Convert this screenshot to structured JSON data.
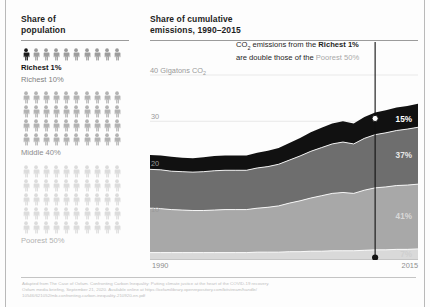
{
  "left_panel": {
    "title": "Share of\npopulation",
    "title_line1": "Share of",
    "title_line2": "population",
    "groups": [
      {
        "key": "richest1",
        "label": "Richest 1%",
        "rows": 0,
        "color": "#1a1a1a"
      },
      {
        "key": "richest10",
        "label": "Richest 10%",
        "rows": 1,
        "color": "#9c9c9c"
      },
      {
        "key": "middle40",
        "label": "Middle 40%",
        "rows": 4,
        "color": "#b3b3b3"
      },
      {
        "key": "poorest50",
        "label": "Poorest 50%",
        "rows": 5,
        "color": "#dcdcdc"
      }
    ],
    "icons_per_row": 10,
    "icon_name": "person-icon"
  },
  "right_panel": {
    "title_line1": "Share of cumulative",
    "title_line2": "emissions, 1990–2015"
  },
  "callout": {
    "part1": "CO",
    "sub": "2",
    "part2": " emissions from the ",
    "bold": "Richest 1%",
    "part3": "are double those of the ",
    "faint": "Poorest 50%"
  },
  "chart_data": {
    "type": "area",
    "title": "Share of cumulative emissions, 1990–2015",
    "subtitle": "",
    "xlabel": "",
    "ylabel": "40 Gigatons CO2",
    "ylabel_text": "40 Gigatons CO",
    "ylabel_sub": "2",
    "ylim": [
      0,
      40
    ],
    "yticks": [
      10,
      20,
      30,
      40
    ],
    "ytick_labels": [
      "10",
      "20",
      "30",
      "40 Gigatons CO₂"
    ],
    "xlim": [
      1990,
      2015
    ],
    "xtick_labels": [
      "1990",
      "2015"
    ],
    "grid": true,
    "legend_position": "inline-right",
    "x": [
      1990,
      1991,
      1992,
      1993,
      1994,
      1995,
      1996,
      1997,
      1998,
      1999,
      2000,
      2001,
      2002,
      2003,
      2004,
      2005,
      2006,
      2007,
      2008,
      2009,
      2010,
      2011,
      2012,
      2013,
      2014,
      2015
    ],
    "series": [
      {
        "name": "Poorest 50%",
        "end_label": "7%",
        "color": "#d9d9d9",
        "values": [
          1.6,
          1.6,
          1.6,
          1.6,
          1.6,
          1.6,
          1.6,
          1.6,
          1.6,
          1.6,
          1.7,
          1.7,
          1.7,
          1.8,
          1.8,
          1.9,
          1.9,
          2.0,
          2.0,
          2.0,
          2.1,
          2.2,
          2.2,
          2.3,
          2.3,
          2.4
        ]
      },
      {
        "name": "Middle 40%",
        "end_label": "41%",
        "color": "#a8a8a8",
        "values": [
          9.6,
          9.5,
          9.3,
          9.2,
          9.1,
          9.1,
          9.2,
          9.3,
          9.3,
          9.3,
          9.5,
          9.7,
          10.0,
          10.5,
          11.0,
          11.5,
          12.0,
          12.4,
          12.6,
          12.4,
          13.0,
          13.4,
          13.6,
          13.8,
          13.9,
          14.0
        ]
      },
      {
        "name": "Richest 10% (excl. top 1%)",
        "end_label": "37%",
        "color": "#6e6e6e",
        "values": [
          8.4,
          8.4,
          8.3,
          8.3,
          8.3,
          8.4,
          8.5,
          8.5,
          8.5,
          8.5,
          8.7,
          8.8,
          9.0,
          9.3,
          9.7,
          10.1,
          10.4,
          10.7,
          10.9,
          10.7,
          11.2,
          11.5,
          11.7,
          11.9,
          12.1,
          12.3
        ]
      },
      {
        "name": "Richest 1%",
        "end_label": "15%",
        "color": "#111111",
        "values": [
          3.1,
          3.1,
          3.1,
          3.0,
          3.0,
          3.1,
          3.2,
          3.2,
          3.2,
          3.2,
          3.3,
          3.4,
          3.5,
          3.7,
          3.9,
          4.1,
          4.3,
          4.4,
          4.5,
          4.4,
          4.6,
          4.8,
          4.9,
          5.0,
          5.0,
          5.1
        ]
      }
    ],
    "totals_note": "Stacked area, total rises from ~22.7 to ~33.8 Gigatons CO2",
    "annotation": {
      "text": "CO2 emissions from the Richest 1% are double those of the Poorest 50%",
      "marker_top_value": "15%",
      "marker_bottom_value": "7%",
      "marker_x": 2011
    }
  },
  "footer": {
    "line1": "Adapted from The Case of Oxfam. Confronting Carbon Inequality: Putting climate justice at the heart of the COVID-19 recovery.",
    "line2": "Oxfam media briefing, September 21, 2020. Available online at https://oxfamilibrary.openrepository.com/bitstream/handle/",
    "line3": "10546/621052/mb-confronting-carbon-inequality-210920-en.pdf"
  },
  "colors": {
    "richest1": "#111111",
    "richest10": "#6e6e6e",
    "middle40": "#a8a8a8",
    "poorest50": "#d9d9d9",
    "rule": "#9b9b9b",
    "text": "#1d1d1d",
    "muted": "#9a9a9a"
  }
}
